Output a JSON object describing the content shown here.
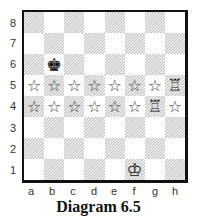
{
  "caption": "Diagram 6.5",
  "board": {
    "files": [
      "a",
      "b",
      "c",
      "d",
      "e",
      "f",
      "g",
      "h"
    ],
    "ranks": [
      "8",
      "7",
      "6",
      "5",
      "4",
      "3",
      "2",
      "1"
    ],
    "light_square_color": "#ffffff",
    "dark_square_style": "diagonal-hatch",
    "pieces": [
      {
        "square": "b6",
        "piece": "king",
        "color": "black",
        "glyph": "♚"
      },
      {
        "square": "h5",
        "piece": "rook",
        "color": "white",
        "glyph": "♖"
      },
      {
        "square": "g4",
        "piece": "rook",
        "color": "white",
        "glyph": "♖"
      },
      {
        "square": "f1",
        "piece": "king",
        "color": "white",
        "glyph": "♔"
      }
    ],
    "markers": [
      {
        "square": "a5",
        "type": "star-icon",
        "glyph": "☆"
      },
      {
        "square": "b5",
        "type": "star-icon",
        "glyph": "☆"
      },
      {
        "square": "c5",
        "type": "star-icon",
        "glyph": "☆"
      },
      {
        "square": "d5",
        "type": "star-icon",
        "glyph": "☆"
      },
      {
        "square": "e5",
        "type": "star-icon",
        "glyph": "☆"
      },
      {
        "square": "f5",
        "type": "star-icon",
        "glyph": "☆"
      },
      {
        "square": "g5",
        "type": "star-icon",
        "glyph": "☆"
      },
      {
        "square": "a4",
        "type": "star-icon",
        "glyph": "☆"
      },
      {
        "square": "b4",
        "type": "star-icon",
        "glyph": "☆"
      },
      {
        "square": "c4",
        "type": "star-icon",
        "glyph": "☆"
      },
      {
        "square": "d4",
        "type": "star-icon",
        "glyph": "☆"
      },
      {
        "square": "e4",
        "type": "star-icon",
        "glyph": "☆"
      },
      {
        "square": "f4",
        "type": "star-icon",
        "glyph": "☆"
      },
      {
        "square": "h4",
        "type": "star-icon",
        "glyph": "☆"
      }
    ]
  }
}
